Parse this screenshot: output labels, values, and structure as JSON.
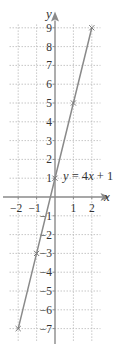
{
  "chart_data": {
    "type": "line",
    "title": "",
    "xlabel": "x",
    "ylabel": "y",
    "xlim": [
      -2.5,
      2.5
    ],
    "ylim": [
      -7.5,
      9.5
    ],
    "grid": true,
    "x_ticks": [
      -2,
      -1,
      1,
      2
    ],
    "y_ticks": [
      9,
      8,
      7,
      6,
      5,
      4,
      3,
      2,
      1,
      -1,
      -2,
      -3,
      -4,
      -5,
      -6,
      -7
    ],
    "series": [
      {
        "name": "y = 4x + 1",
        "equation": "y = 4x + 1",
        "x": [
          -2,
          -1,
          0,
          1,
          2
        ],
        "y": [
          -7,
          -3,
          1,
          5,
          9
        ],
        "marked_points": [
          [
            -2,
            -7
          ],
          [
            -1,
            -3
          ],
          [
            0,
            1
          ],
          [
            1,
            5
          ],
          [
            2,
            9
          ]
        ]
      }
    ],
    "annotation": {
      "text_y": "y",
      "text_eq": " = 4",
      "text_x": "x",
      "text_rest": " + 1"
    },
    "colors": {
      "line": "#8a8a8a",
      "grid": "#b8b8b8",
      "axis": "#8a8a8a",
      "text": "#333333"
    }
  }
}
